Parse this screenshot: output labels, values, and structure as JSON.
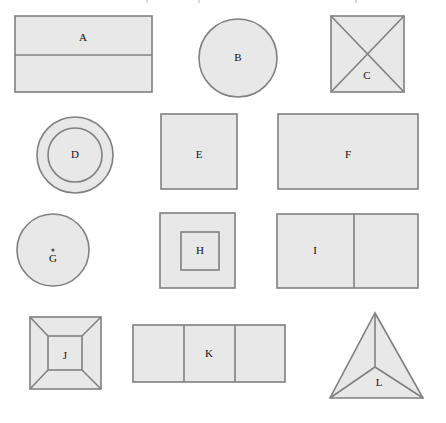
{
  "figure": {
    "background_color": "#ffffff",
    "fill_color": "#e8e8e8",
    "stroke_color": "#808080",
    "label_color": "#111111",
    "rows": 4,
    "columns": 3,
    "shape_count": 12
  },
  "shapes": [
    {
      "id": "A",
      "label": "A",
      "type": "rectangle-divided-horizontal",
      "description": "Rectangle split by one horizontal line into two parts",
      "row": 1,
      "column": 1,
      "x": 15,
      "y": 16,
      "width": 137,
      "height": 76,
      "divider_y": 55,
      "label_x": 83,
      "label_y": 38
    },
    {
      "id": "B",
      "label": "B",
      "type": "circle",
      "description": "Plain circle",
      "row": 1,
      "column": 2,
      "cx": 238,
      "cy": 58,
      "r": 39,
      "label_x": 238,
      "label_y": 58
    },
    {
      "id": "C",
      "label": "C",
      "type": "square-with-diagonals",
      "description": "Square crossed by both diagonals forming an X",
      "row": 1,
      "column": 3,
      "x": 331,
      "y": 16,
      "width": 73,
      "height": 76,
      "label_x": 367,
      "label_y": 76
    },
    {
      "id": "D",
      "label": "D",
      "type": "concentric-circles",
      "description": "Circle containing a smaller concentric circle",
      "row": 2,
      "column": 1,
      "cx": 75,
      "cy": 155,
      "r_outer": 38,
      "r_inner": 27,
      "label_x": 75,
      "label_y": 155
    },
    {
      "id": "E",
      "label": "E",
      "type": "square",
      "description": "Plain square",
      "row": 2,
      "column": 2,
      "x": 161,
      "y": 114,
      "width": 76,
      "height": 75,
      "label_x": 199,
      "label_y": 155
    },
    {
      "id": "F",
      "label": "F",
      "type": "rectangle",
      "description": "Plain wide rectangle",
      "row": 2,
      "column": 3,
      "x": 278,
      "y": 114,
      "width": 140,
      "height": 75,
      "label_x": 348,
      "label_y": 155
    },
    {
      "id": "G",
      "label": "G",
      "type": "circle-with-center-point",
      "description": "Circle with a marked centre point",
      "row": 3,
      "column": 1,
      "cx": 53,
      "cy": 250,
      "r": 36,
      "dot_r": 1.6,
      "label_x": 53,
      "label_y": 259
    },
    {
      "id": "H",
      "label": "H",
      "type": "nested-squares",
      "description": "Square containing a smaller concentric square",
      "row": 3,
      "column": 2,
      "x": 160,
      "y": 213,
      "width": 75,
      "height": 75,
      "inner_x": 181,
      "inner_y": 232,
      "inner_width": 38,
      "inner_height": 38,
      "label_x": 200,
      "label_y": 251
    },
    {
      "id": "I",
      "label": "I",
      "type": "rectangle-divided-vertical",
      "description": "Rectangle split by one vertical line into two parts",
      "row": 3,
      "column": 3,
      "x": 277,
      "y": 214,
      "width": 141,
      "height": 74,
      "divider_x": 354,
      "label_x": 315,
      "label_y": 251
    },
    {
      "id": "J",
      "label": "J",
      "type": "nested-square-with-corner-diagonals",
      "description": "Square containing a smaller square, corners joined by four diagonals",
      "row": 4,
      "column": 1,
      "x": 30,
      "y": 317,
      "width": 71,
      "height": 72,
      "inner_x": 48,
      "inner_y": 336,
      "inner_width": 34,
      "inner_height": 34,
      "label_x": 65,
      "label_y": 356
    },
    {
      "id": "K",
      "label": "K",
      "type": "rectangle-divided-thirds",
      "description": "Rectangle split by two vertical lines into three equal cells",
      "row": 4,
      "column": 2,
      "x": 133,
      "y": 325,
      "width": 152,
      "height": 57,
      "divider_x1": 184,
      "divider_x2": 235,
      "label_x": 209,
      "label_y": 354
    },
    {
      "id": "L",
      "label": "L",
      "type": "triangle-with-interior-point",
      "description": "Triangle with three lines from an interior point to the vertices",
      "row": 4,
      "column": 3,
      "apex_x": 375,
      "apex_y": 313,
      "left_x": 330,
      "left_y": 398,
      "right_x": 423,
      "right_y": 398,
      "interior_x": 375,
      "interior_y": 367,
      "label_x": 379,
      "label_y": 383
    }
  ]
}
